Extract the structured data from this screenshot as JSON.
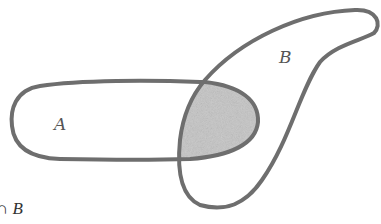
{
  "diagram": {
    "type": "venn",
    "sets": [
      {
        "id": "A",
        "label": "A"
      },
      {
        "id": "B",
        "label": "B"
      }
    ],
    "shaded_region": "A ∩ B",
    "caption": {
      "operator": "∩",
      "set": "B"
    },
    "colors": {
      "outline": "#6e6e6e",
      "shade": "#c4c4c4",
      "label": "#555555",
      "background": "#ffffff"
    }
  }
}
